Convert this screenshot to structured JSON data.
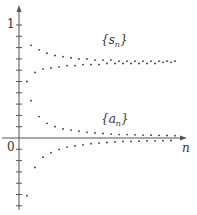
{
  "chart_data": {
    "type": "scatter",
    "title": "",
    "xlabel": "n",
    "ylabel": "",
    "y_tick_labels": [
      "0",
      "1"
    ],
    "ylim": [
      -0.65,
      1.15
    ],
    "grid": false,
    "series": [
      {
        "name": "{s_n}",
        "x": [
          1,
          2,
          3,
          4,
          5,
          6,
          7,
          8,
          9,
          10,
          11,
          12,
          13,
          14,
          15,
          16,
          17,
          18,
          19,
          20,
          21,
          22,
          23,
          24,
          25,
          26,
          27,
          28,
          29,
          30,
          31,
          32,
          33,
          34,
          35,
          36,
          37,
          38,
          39,
          40
        ],
        "values": [
          0.5,
          0.82,
          0.58,
          0.78,
          0.61,
          0.75,
          0.62,
          0.73,
          0.63,
          0.72,
          0.64,
          0.71,
          0.64,
          0.7,
          0.65,
          0.7,
          0.65,
          0.69,
          0.65,
          0.69,
          0.66,
          0.69,
          0.66,
          0.68,
          0.66,
          0.68,
          0.66,
          0.68,
          0.66,
          0.68,
          0.66,
          0.68,
          0.66,
          0.68,
          0.67,
          0.68,
          0.67,
          0.68,
          0.67,
          0.68
        ]
      },
      {
        "name": "{a_n}",
        "x": [
          1,
          2,
          3,
          4,
          5,
          6,
          7,
          8,
          9,
          10,
          11,
          12,
          13,
          14,
          15,
          16,
          17,
          18,
          19,
          20,
          21,
          22,
          23,
          24,
          25,
          26,
          27,
          28,
          29,
          30,
          31,
          32,
          33,
          34,
          35,
          36,
          37,
          38,
          39,
          40
        ],
        "values": [
          -0.51,
          0.33,
          -0.26,
          0.19,
          -0.17,
          0.13,
          -0.13,
          0.1,
          -0.1,
          0.08,
          -0.08,
          0.07,
          -0.07,
          0.06,
          -0.06,
          0.05,
          -0.05,
          0.045,
          -0.045,
          0.04,
          -0.04,
          0.035,
          -0.035,
          0.03,
          -0.03,
          0.03,
          -0.03,
          0.028,
          -0.028,
          0.026,
          -0.026,
          0.025,
          -0.025,
          0.024,
          -0.024,
          0.022,
          -0.022,
          0.021,
          -0.021,
          0.02
        ]
      }
    ],
    "annotations": [
      "{s_n}",
      "{a_n}"
    ]
  },
  "labels": {
    "s_label": "{s",
    "s_sub": "n",
    "s_close": "}",
    "a_label": "{a",
    "a_sub": "n",
    "a_close": "}",
    "x_axis": "n",
    "one": "1",
    "zero": "0"
  }
}
